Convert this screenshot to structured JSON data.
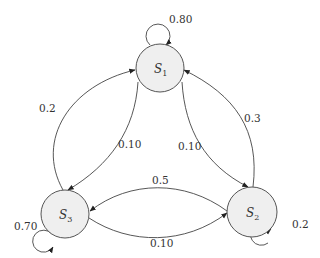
{
  "diagram": {
    "type": "markov-chain-state-diagram",
    "colors": {
      "node_fill": "#efefef",
      "node_stroke": "#555555",
      "edge_stroke": "#444444",
      "text": "#333333"
    },
    "states": [
      {
        "id": "S1",
        "letter": "S",
        "sub": "1"
      },
      {
        "id": "S2",
        "letter": "S",
        "sub": "2"
      },
      {
        "id": "S3",
        "letter": "S",
        "sub": "3"
      }
    ],
    "transitions": [
      {
        "from": "S1",
        "to": "S1",
        "label": "0.80"
      },
      {
        "from": "S1",
        "to": "S2",
        "label": "0.10"
      },
      {
        "from": "S1",
        "to": "S3",
        "label": "0.10"
      },
      {
        "from": "S2",
        "to": "S1",
        "label": "0.3"
      },
      {
        "from": "S2",
        "to": "S2",
        "label": "0.2"
      },
      {
        "from": "S2",
        "to": "S3",
        "label": "0.5"
      },
      {
        "from": "S3",
        "to": "S1",
        "label": "0.2"
      },
      {
        "from": "S3",
        "to": "S2",
        "label": "0.10"
      },
      {
        "from": "S3",
        "to": "S3",
        "label": "0.70"
      }
    ]
  }
}
